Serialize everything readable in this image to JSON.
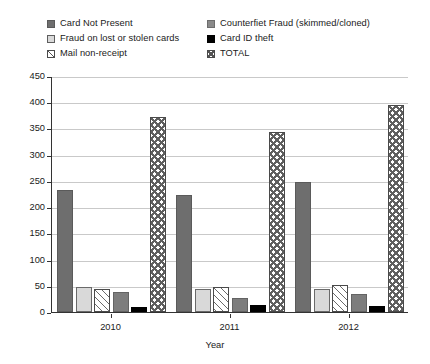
{
  "chart_data": {
    "type": "bar",
    "title": "",
    "subtitle": "",
    "xlabel": "Year",
    "ylabel": "",
    "categories": [
      "2010",
      "2011",
      "2012"
    ],
    "ylim": [
      0,
      450
    ],
    "ytick_step": 50,
    "yticks": [
      "450",
      "400",
      "350",
      "300",
      "250",
      "200",
      "150",
      "100",
      "50",
      "0"
    ],
    "grid": true,
    "legend_position": "top",
    "series": [
      {
        "name": "Card Not Present",
        "pattern": "solid-dark-gray",
        "color": "#6e6e6e",
        "values": [
          232,
          224,
          248
        ]
      },
      {
        "name": "Fraud on lost or stolen cards",
        "pattern": "solid-light-gray",
        "color": "#d9d9d9",
        "values": [
          48,
          44,
          44
        ]
      },
      {
        "name": "Counterfiet Fraud (skimmed/cloned)",
        "pattern": "diagonal-hatch",
        "color": "#8a8a8a",
        "values": [
          44,
          48,
          52
        ]
      },
      {
        "name": "Card ID theft",
        "pattern": "solid-mid-gray",
        "color": "#7d7d7d",
        "values": [
          38,
          26,
          34
        ]
      },
      {
        "name": "Mail non-receipt",
        "pattern": "solid-black",
        "color": "#000000",
        "values": [
          9,
          14,
          12
        ]
      },
      {
        "name": "TOTAL",
        "pattern": "cross-hatch",
        "color": "#ffffff",
        "values": [
          371,
          344,
          394
        ]
      }
    ]
  },
  "legend": {
    "items": [
      {
        "label": "Card Not Present",
        "swatch": "swatch-card-not-present"
      },
      {
        "label": "Counterfiet Fraud (skimmed/cloned)",
        "swatch": "swatch-counterfeit-fraud"
      },
      {
        "label": "Fraud on lost or stolen cards",
        "swatch": "swatch-fraud-lost-stolen"
      },
      {
        "label": "Card ID theft",
        "swatch": "swatch-card-id-theft"
      },
      {
        "label": "Mail non-receipt",
        "swatch": "swatch-mail-non-receipt"
      },
      {
        "label": "TOTAL",
        "swatch": "swatch-total"
      }
    ]
  },
  "axes": {
    "x_title": "Year",
    "x_labels": [
      "2010",
      "2011",
      "2012"
    ],
    "y_labels": [
      "450",
      "400",
      "350",
      "300",
      "250",
      "200",
      "150",
      "100",
      "50",
      "0"
    ]
  }
}
